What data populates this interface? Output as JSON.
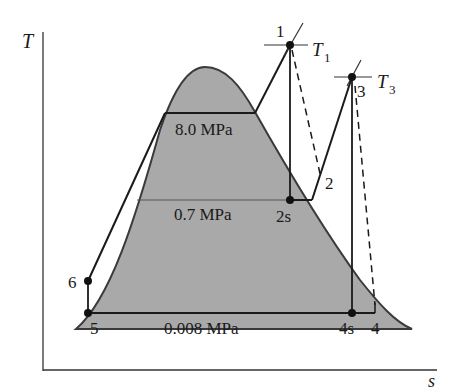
{
  "diagram": {
    "axes": {
      "y_label": "T",
      "x_label": "s"
    },
    "pressure_lines": [
      {
        "id": "high",
        "label": "8.0 MPa"
      },
      {
        "id": "mid",
        "label": "0.7 MPa"
      },
      {
        "id": "low",
        "label": "0.008 MPa"
      }
    ],
    "states": {
      "p1": "1",
      "p2": "2",
      "p2s": "2s",
      "p3": "3",
      "p4": "4",
      "p4s": "4s",
      "p5": "5",
      "p6": "6"
    },
    "isotherms": {
      "t1_main": "T",
      "t1_sub": "1",
      "t3_main": "T",
      "t3_sub": "3"
    },
    "colors": {
      "dome_fill": "#a9a9a9",
      "line": "#1a1a1a",
      "axis": "#333333"
    }
  }
}
